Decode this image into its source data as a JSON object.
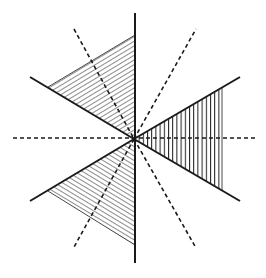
{
  "diagram": {
    "title": "",
    "width": 266,
    "height": 278,
    "center": [
      134,
      139
    ],
    "colors": {
      "stroke": "#1a1a1a",
      "background": "#ffffff"
    },
    "solid_lines": [
      {
        "name": "vertical-axis",
        "from": [
          135,
          13
        ],
        "to": [
          135,
          263
        ]
      },
      {
        "name": "upper-left-ray",
        "from": [
          30,
          77
        ],
        "to": [
          134,
          139
        ]
      },
      {
        "name": "lower-left-ray",
        "from": [
          30,
          201
        ],
        "to": [
          134,
          139
        ]
      },
      {
        "name": "upper-right-ray",
        "from": [
          134,
          139
        ],
        "to": [
          240,
          77
        ]
      },
      {
        "name": "lower-right-ray",
        "from": [
          134,
          139
        ],
        "to": [
          240,
          201
        ]
      }
    ],
    "dashed_lines": [
      {
        "name": "horizontal-axis",
        "from": [
          13,
          138
        ],
        "to": [
          257,
          138
        ]
      },
      {
        "name": "upper-left-dashed",
        "from": [
          74,
          29
        ],
        "to": [
          134,
          139
        ]
      },
      {
        "name": "lower-left-dashed",
        "from": [
          134,
          139
        ],
        "to": [
          74,
          247
        ]
      },
      {
        "name": "upper-right-dashed",
        "from": [
          134,
          139
        ],
        "to": [
          196,
          29
        ]
      },
      {
        "name": "lower-right-dashed",
        "from": [
          134,
          139
        ],
        "to": [
          196,
          248
        ]
      }
    ],
    "hatched_regions": [
      {
        "name": "upper-left-wedge",
        "points": [
          [
            134,
            139
          ],
          [
            48,
            87
          ],
          [
            135,
            35
          ]
        ],
        "hatch": "diagonal",
        "spacing": 4
      },
      {
        "name": "lower-left-wedge",
        "points": [
          [
            134,
            139
          ],
          [
            48,
            191
          ],
          [
            135,
            245
          ]
        ],
        "hatch": "diagonal-mirror",
        "spacing": 4
      },
      {
        "name": "right-wedge",
        "points": [
          [
            134,
            139
          ],
          [
            222,
            88
          ],
          [
            222,
            190
          ]
        ],
        "hatch": "vertical",
        "spacing": 4
      }
    ]
  }
}
